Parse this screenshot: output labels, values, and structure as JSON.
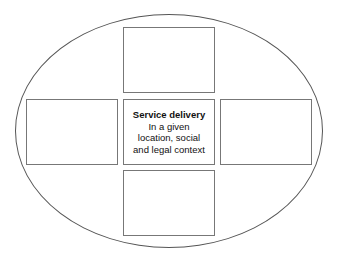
{
  "diagram": {
    "center": {
      "title": "Service delivery",
      "lines": [
        "In a given",
        "location, social",
        "and legal context"
      ]
    },
    "outer_shape": "ellipse",
    "surrounding_boxes": [
      "top",
      "left",
      "right",
      "bottom"
    ]
  }
}
